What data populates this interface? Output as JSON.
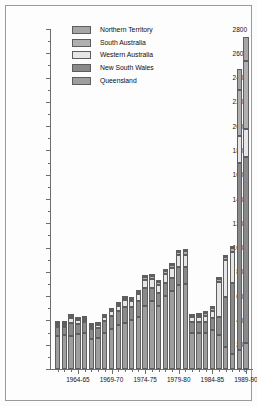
{
  "chart_data": {
    "type": "bar",
    "subtype": "stacked-bar",
    "title": "",
    "xlabel": "",
    "ylabel": "",
    "ylim": [
      0,
      2800
    ],
    "ytick_step": 200,
    "yticks": [
      0,
      200,
      400,
      600,
      800,
      1000,
      1200,
      1400,
      1600,
      1800,
      2000,
      2200,
      2400,
      2600,
      2800
    ],
    "ytick_labels": [
      "0",
      "200",
      "400",
      "600",
      "800",
      "1000",
      "1200",
      "1400",
      "1600",
      "1800",
      "2000",
      "2200",
      "2400",
      "2600",
      "2800"
    ],
    "grid": false,
    "legend_position": "top-left-inside",
    "categories": [
      "1961-62",
      "1962-63",
      "1963-64",
      "1964-65",
      "1965-66",
      "1966-67",
      "1967-68",
      "1968-69",
      "1969-70",
      "1970-71",
      "1971-72",
      "1972-73",
      "1973-74",
      "1974-75",
      "1975-76",
      "1976-77",
      "1977-78",
      "1978-79",
      "1979-80",
      "1980-81",
      "1981-82",
      "1982-83",
      "1983-84",
      "1984-85",
      "1985-86",
      "1986-87",
      "1987-88",
      "1988-89",
      "1989-90"
    ],
    "xtick_labels": [
      "1964-65",
      "1969-70",
      "1974-75",
      "1979-80",
      "1984-85",
      "1989-90"
    ],
    "xtick_categories": [
      "1964-65",
      "1969-70",
      "1974-75",
      "1979-80",
      "1984-85",
      "1989-90"
    ],
    "series": [
      {
        "name": "Queensland",
        "color": "#9e9e9e",
        "values": [
          270,
          280,
          275,
          285,
          300,
          250,
          255,
          300,
          330,
          360,
          380,
          400,
          430,
          520,
          560,
          520,
          600,
          640,
          690,
          700,
          300,
          300,
          300,
          320,
          280,
          180,
          120,
          160,
          215
        ]
      },
      {
        "name": "New South Wales",
        "color": "#8a8a8a",
        "values": [
          75,
          70,
          100,
          85,
          85,
          80,
          80,
          95,
          110,
          115,
          130,
          110,
          130,
          150,
          110,
          105,
          105,
          110,
          150,
          140,
          85,
          90,
          90,
          100,
          150,
          410,
          590,
          1540,
          1530
        ]
      },
      {
        "name": "Western Australia",
        "color": "#e6e6e6",
        "values": [
          20,
          15,
          45,
          30,
          20,
          20,
          25,
          30,
          35,
          40,
          55,
          50,
          55,
          65,
          75,
          70,
          80,
          85,
          95,
          100,
          40,
          40,
          50,
          60,
          290,
          310,
          250,
          220,
          230
        ]
      },
      {
        "name": "South Australia",
        "color": "#b0b0b0",
        "values": [
          10,
          10,
          15,
          12,
          12,
          10,
          12,
          15,
          15,
          20,
          20,
          18,
          20,
          25,
          20,
          20,
          22,
          25,
          30,
          30,
          15,
          15,
          18,
          20,
          20,
          25,
          40,
          380,
          560
        ]
      },
      {
        "name": "Northern Territory",
        "color": "#a6a6a6",
        "values": [
          5,
          5,
          5,
          5,
          5,
          5,
          5,
          5,
          5,
          5,
          5,
          5,
          5,
          8,
          8,
          8,
          10,
          10,
          10,
          10,
          5,
          5,
          5,
          5,
          10,
          10,
          15,
          170,
          200
        ]
      }
    ],
    "totals": [
      380,
      380,
      440,
      417,
      422,
      365,
      377,
      445,
      495,
      540,
      590,
      583,
      640,
      768,
      773,
      723,
      817,
      870,
      975,
      980,
      445,
      450,
      463,
      505,
      750,
      935,
      1015,
      2470,
      2735
    ]
  },
  "legend": {
    "items": [
      {
        "label": "Northern Territory",
        "color": "#a6a6a6"
      },
      {
        "label": "South Australia",
        "color": "#b0b0b0"
      },
      {
        "label": "Western Australia",
        "color": "#e6e6e6"
      },
      {
        "label": "New South Wales",
        "color": "#8a8a8a"
      },
      {
        "label": "Queensland",
        "color": "#9e9e9e"
      }
    ]
  },
  "axis": {
    "y_max_label": "2800",
    "y_min_label": "0"
  }
}
